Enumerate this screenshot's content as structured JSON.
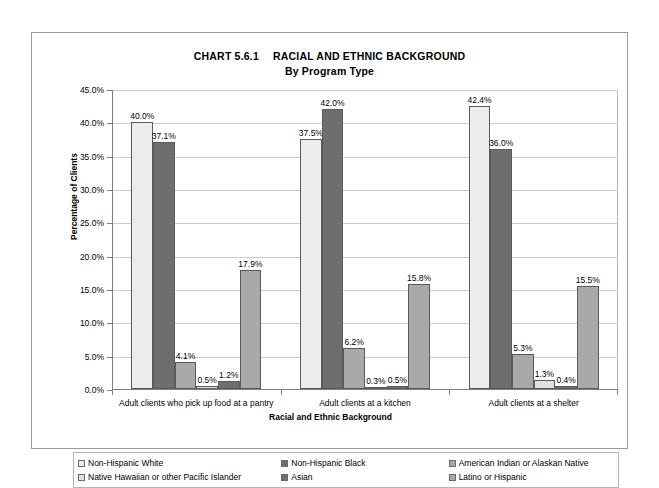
{
  "title": {
    "chart_number": "CHART 5.6.1",
    "main": "RACIAL AND ETHNIC BACKGROUND",
    "sub": "By Program Type"
  },
  "axes": {
    "ylabel": "Percentage of Clients",
    "xlabel": "Racial and Ethnic Background",
    "yticks": [
      "0.0%",
      "5.0%",
      "10.0%",
      "15.0%",
      "20.0%",
      "25.0%",
      "30.0%",
      "35.0%",
      "40.0%",
      "45.0%"
    ]
  },
  "legend": {
    "items": [
      {
        "label": "Non-Hispanic White",
        "color": "#ececec"
      },
      {
        "label": "Non-Hispanic Black",
        "color": "#6e6e6e"
      },
      {
        "label": "American Indian or Alaskan Native",
        "color": "#a9a9a9"
      },
      {
        "label": "Native Hawaiian or other Pacific Islander",
        "color": "#e0e0e0"
      },
      {
        "label": "Asian",
        "color": "#6e6e6e"
      },
      {
        "label": "Latino or Hispanic",
        "color": "#a9a9a9"
      }
    ]
  },
  "chart_data": {
    "type": "bar",
    "xlabel": "Racial and Ethnic Background",
    "ylabel": "Percentage of Clients",
    "ylim": [
      0,
      45
    ],
    "ytick_step": 5,
    "grid": true,
    "legend_position": "bottom",
    "categories": [
      "Adult clients who pick up food at a pantry",
      "Adult clients at a kitchen",
      "Adult clients at a shelter"
    ],
    "series": [
      {
        "name": "Non-Hispanic White",
        "color": "#ececec",
        "values": [
          40.0,
          37.5,
          42.4
        ],
        "labels": [
          "40.0%",
          "37.5%",
          "42.4%"
        ]
      },
      {
        "name": "Non-Hispanic Black",
        "color": "#6e6e6e",
        "values": [
          37.1,
          42.0,
          36.0
        ],
        "labels": [
          "37.1%",
          "42.0%",
          "36.0%"
        ]
      },
      {
        "name": "American Indian or Alaskan Native",
        "color": "#a9a9a9",
        "values": [
          4.1,
          6.2,
          5.3
        ],
        "labels": [
          "4.1%",
          "6.2%",
          "5.3%"
        ]
      },
      {
        "name": "Native Hawaiian or other Pacific Islander",
        "color": "#e0e0e0",
        "values": [
          0.5,
          0.3,
          1.3
        ],
        "labels": [
          "0.5%",
          "0.3%",
          "1.3%"
        ]
      },
      {
        "name": "Asian",
        "color": "#6e6e6e",
        "values": [
          1.2,
          0.5,
          0.4
        ],
        "labels": [
          "1.2%",
          "0.5%",
          "0.4%"
        ]
      },
      {
        "name": "Latino or Hispanic",
        "color": "#a9a9a9",
        "values": [
          17.9,
          15.8,
          15.5
        ],
        "labels": [
          "17.9%",
          "15.8%",
          "15.5%"
        ]
      }
    ]
  }
}
